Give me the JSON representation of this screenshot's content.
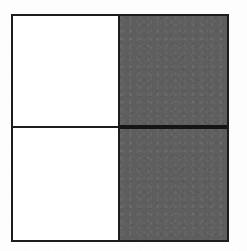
{
  "figure": {
    "shape": "square",
    "border_color": "#1d1d1d",
    "border_width_px": 2,
    "background_color": "#ffffff",
    "shaded_color": "#5e5e5e",
    "unshaded_color": "#ffffff",
    "rows": 2,
    "columns": 2,
    "total_parts": 4,
    "shaded_parts": 2,
    "fraction_shaded": "2/4",
    "dividers": {
      "vertical_label": "vertical-divider",
      "horizontal_label": "horizontal-divider"
    },
    "quadrants": [
      {
        "position": "top-left",
        "state": "unshaded",
        "fill": "#ffffff"
      },
      {
        "position": "top-right",
        "state": "shaded",
        "fill": "#5e5e5e"
      },
      {
        "position": "bottom-left",
        "state": "unshaded",
        "fill": "#ffffff"
      },
      {
        "position": "bottom-right",
        "state": "shaded",
        "fill": "#5e5e5e"
      }
    ]
  }
}
